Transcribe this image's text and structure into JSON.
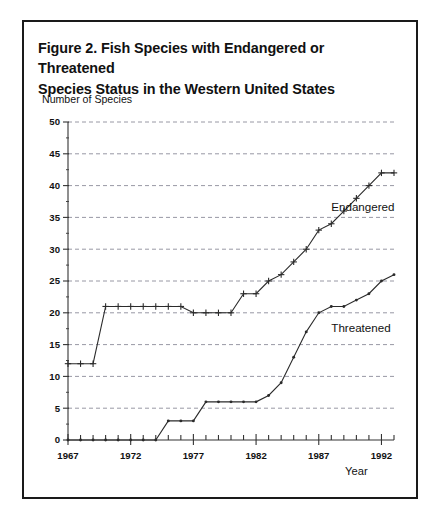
{
  "figure": {
    "title_line1": "Figure 2.  Fish Species with Endangered or Threatened",
    "title_line2": "Species Status in the Western United States",
    "y_axis_title": "Number of Species",
    "x_axis_title": "Year",
    "border_color": "#1a1a1a",
    "background_color": "#ffffff",
    "line_color": "#2b2b2b",
    "grid_color": "#8c8c9a"
  },
  "chart_data": {
    "type": "line",
    "title": "Figure 2.  Fish Species with Endangered or Threatened Species Status in the Western United States",
    "xlabel": "Year",
    "ylabel": "Number of Species",
    "xlim": [
      1967,
      1993
    ],
    "ylim": [
      0,
      50
    ],
    "ytick_interval": 5,
    "yticks": [
      0,
      5,
      10,
      15,
      20,
      25,
      30,
      35,
      40,
      45,
      50
    ],
    "ytick_labels": [
      "0",
      "5",
      "10",
      "15",
      "20",
      "25",
      "30",
      "35",
      "40",
      "45",
      "50"
    ],
    "xtick_interval": 1,
    "xtick_labels_shown": [
      "1967",
      "1972",
      "1977",
      "1982",
      "1987",
      "1992"
    ],
    "xtick_labels_interval": 5,
    "grid": "horizontal-dashed",
    "legend_position": "inline-annotation",
    "x": [
      1967,
      1968,
      1969,
      1970,
      1971,
      1972,
      1973,
      1974,
      1975,
      1976,
      1977,
      1978,
      1979,
      1980,
      1981,
      1982,
      1983,
      1984,
      1985,
      1986,
      1987,
      1988,
      1989,
      1990,
      1991,
      1992,
      1993
    ],
    "series": [
      {
        "name": "Endangered",
        "marker": "plus",
        "values": [
          12,
          12,
          12,
          21,
          21,
          21,
          21,
          21,
          21,
          21,
          20,
          20,
          20,
          20,
          23,
          23,
          25,
          26,
          28,
          30,
          33,
          34,
          36,
          38,
          40,
          42,
          42
        ]
      },
      {
        "name": "Threatened",
        "marker": "dot",
        "values": [
          0,
          0,
          0,
          0,
          0,
          0,
          0,
          0,
          3,
          3,
          3,
          6,
          6,
          6,
          6,
          6,
          7,
          9,
          13,
          17,
          20,
          21,
          21,
          22,
          23,
          25,
          26
        ]
      }
    ],
    "annotations": [
      {
        "text": "Endangered",
        "x": 1988,
        "y": 36
      },
      {
        "text": "Threatened",
        "x": 1988,
        "y": 17
      }
    ]
  }
}
